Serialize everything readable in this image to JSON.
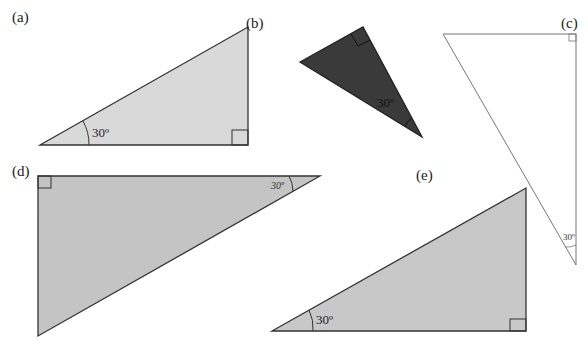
{
  "diagram": {
    "figures": [
      {
        "label": "(a)",
        "angle_text": "30º",
        "fill": "#d9d9d9",
        "stroke": "#333333",
        "orientation": "right angle bottom-right, 30° at bottom-left"
      },
      {
        "label": "(b)",
        "angle_text": "30º",
        "fill": "#3a3a3a",
        "stroke": "#222222",
        "orientation": "rotated, right angle at top, 30° at bottom-right"
      },
      {
        "label": "(c)",
        "angle_text": "30º",
        "fill": "#ffffff",
        "stroke": "#777777",
        "orientation": "right angle top-right, 30° at bottom"
      },
      {
        "label": "(d)",
        "angle_text": "30º",
        "fill": "#c4c4c4",
        "stroke": "#333333",
        "orientation": "right angle top-left, 30° at top-right"
      },
      {
        "label": "(e)",
        "angle_text": "30º",
        "fill": "#c8c8c8",
        "stroke": "#333333",
        "orientation": "right angle bottom-right, 30° at bottom-left"
      }
    ]
  }
}
